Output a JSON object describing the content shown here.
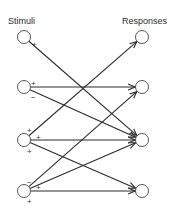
{
  "title": "",
  "headers": {
    "stimuli": "Stimuli",
    "responses": "Responses"
  },
  "colors": {
    "line": "#2a2a2a",
    "node_stroke": "#444444",
    "background": "#ffffff"
  },
  "stimuli": [
    {
      "id": "S1"
    },
    {
      "id": "S2"
    },
    {
      "id": "S3"
    },
    {
      "id": "S4"
    }
  ],
  "responses": [
    {
      "id": "R1"
    },
    {
      "id": "R2"
    },
    {
      "id": "R3"
    },
    {
      "id": "R4"
    }
  ],
  "connections": [
    {
      "from": "S1",
      "to": "R3",
      "sign": "+"
    },
    {
      "from": "S2",
      "to": "R2",
      "sign": "+"
    },
    {
      "from": "S2",
      "to": "R3",
      "sign": "−"
    },
    {
      "from": "S3",
      "to": "R1",
      "sign": "+"
    },
    {
      "from": "S3",
      "to": "R3",
      "sign": "+"
    },
    {
      "from": "S3",
      "to": "R4",
      "sign": "+"
    },
    {
      "from": "S4",
      "to": "R2",
      "sign": "−"
    },
    {
      "from": "S4",
      "to": "R3",
      "sign": "+"
    },
    {
      "from": "S4",
      "to": "R4",
      "sign": "+"
    }
  ]
}
